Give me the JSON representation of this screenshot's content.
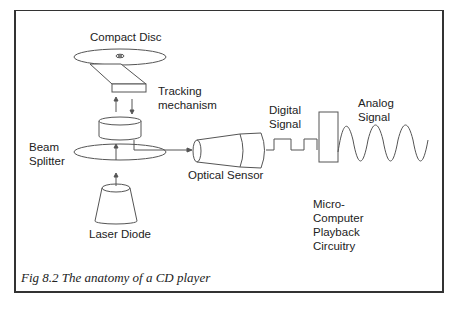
{
  "figure": {
    "caption": "Fig 8.2 The anatomy of a CD player",
    "labels": {
      "compact_disc": "Compact Disc",
      "tracking_mechanism": "Tracking\nmechanism",
      "beam_splitter": "Beam\nSplitter",
      "laser_diode": "Laser Diode",
      "optical_sensor": "Optical Sensor",
      "digital_signal": "Digital\nSignal",
      "analog_signal": "Analog\nSignal",
      "micro_computer": "Micro-\nComputer\nPlayback\nCircuitry"
    },
    "colors": {
      "line": "#555555",
      "frame": "#333333",
      "text": "#222222"
    }
  },
  "body_text_clipped": ""
}
